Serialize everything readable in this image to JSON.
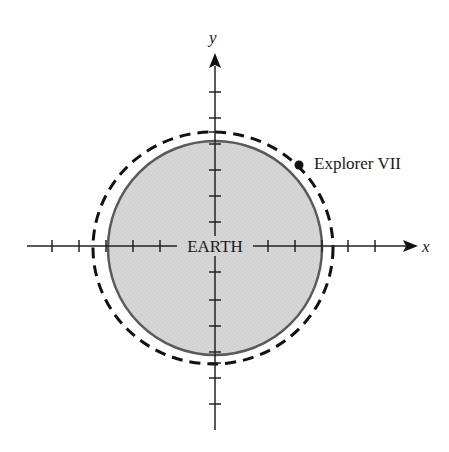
{
  "diagram": {
    "axes": {
      "x_label": "x",
      "y_label": "y",
      "origin": [
        215,
        246
      ],
      "tick_spacing_px": 26.8,
      "x_ticks_px": [
        52,
        79,
        106,
        133,
        160,
        268,
        295,
        322,
        348,
        375
      ],
      "y_ticks_px": [
        92,
        118,
        144,
        170,
        196,
        222,
        300,
        326,
        352,
        378,
        404
      ]
    },
    "earth": {
      "label": "EARTH",
      "center": [
        215,
        248
      ],
      "radius": 107,
      "fill": "#d4d4d4",
      "stroke": "#555555"
    },
    "orbit": {
      "style": "dashed",
      "center": [
        213,
        248
      ],
      "rx": 120,
      "ry": 116,
      "stroke": "#111111"
    },
    "satellite": {
      "label": "Explorer VII",
      "position": [
        299,
        165
      ]
    }
  }
}
